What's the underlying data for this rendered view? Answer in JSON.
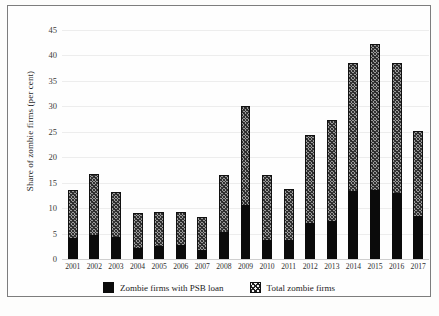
{
  "chart_data": {
    "type": "bar",
    "title": "",
    "subtitle": "",
    "xlabel": "",
    "ylabel": "Share of zombie firms (per cent)",
    "stacked_overlay": true,
    "grid": true,
    "legend_position": "bottom",
    "ylim": [
      0,
      45
    ],
    "yticks": [
      0,
      5,
      10,
      15,
      20,
      25,
      30,
      35,
      40,
      45
    ],
    "categories": [
      "2001",
      "2002",
      "2003",
      "2004",
      "2005",
      "2006",
      "2007",
      "2008",
      "2009",
      "2010",
      "2011",
      "2012",
      "2013",
      "2014",
      "2015",
      "2016",
      "2017"
    ],
    "series": [
      {
        "name": "Zombie firms with PSB loan",
        "style": "solid-black",
        "color": "#0b0b0b",
        "values": [
          4.2,
          4.7,
          4.3,
          2.1,
          2.6,
          2.7,
          1.7,
          5.3,
          10.6,
          3.8,
          3.7,
          7.1,
          7.5,
          13.4,
          13.5,
          13.0,
          8.5
        ]
      },
      {
        "name": "Total zombie firms",
        "style": "hatched",
        "color": "#9a9a9a",
        "values": [
          13.5,
          16.8,
          13.2,
          9.0,
          9.2,
          9.2,
          8.2,
          16.6,
          30.1,
          16.6,
          13.7,
          24.3,
          27.3,
          38.5,
          42.3,
          38.6,
          25.1
        ]
      }
    ]
  },
  "axis": {
    "y_title": "Share of zombie firms (per cent)",
    "y_ticks": [
      "45",
      "40",
      "35",
      "30",
      "25",
      "20",
      "15",
      "10",
      "5",
      "0"
    ],
    "x_ticks": [
      "2001",
      "2002",
      "2003",
      "2004",
      "2005",
      "2006",
      "2007",
      "2008",
      "2009",
      "2010",
      "2011",
      "2012",
      "2013",
      "2014",
      "2015",
      "2016",
      "2017"
    ]
  },
  "legend": {
    "items": [
      {
        "label": "Zombie firms with PSB loan",
        "swatch": "solid-black-square"
      },
      {
        "label": "Total zombie firms",
        "swatch": "hatched-square"
      }
    ]
  }
}
